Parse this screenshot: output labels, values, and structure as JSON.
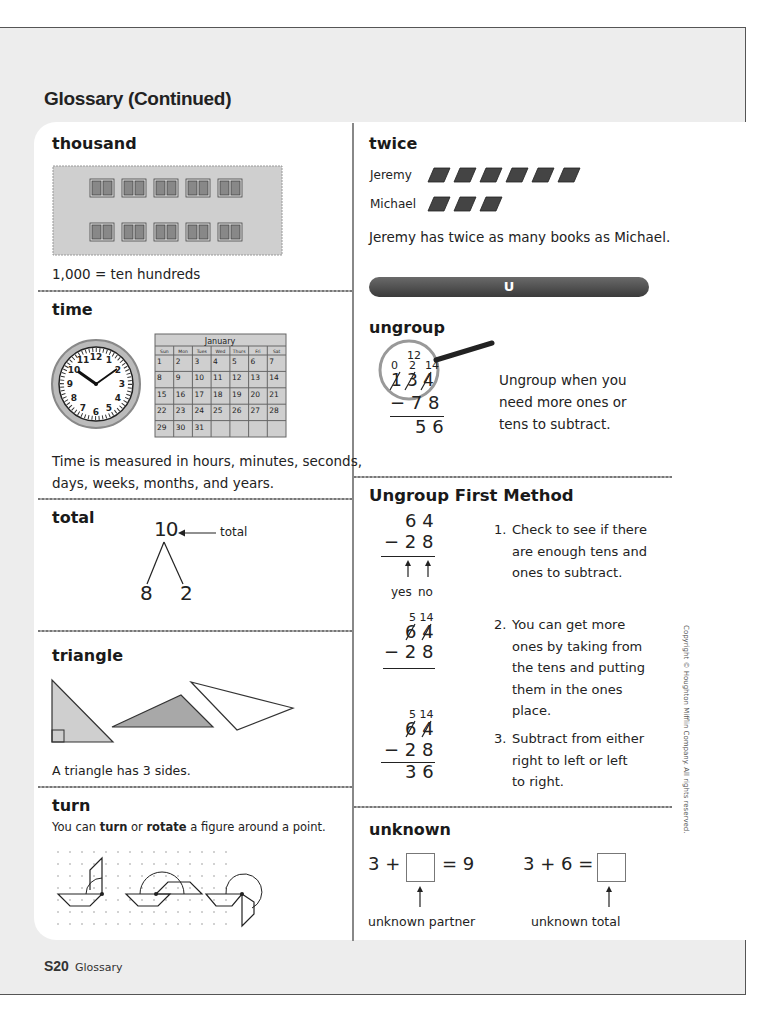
{
  "page": {
    "title": "Glossary (Continued)",
    "footer": {
      "page_number": "S20",
      "section": "Glossary"
    },
    "copyright": "Copyright © Houghton Mifflin Company. All rights reserved."
  },
  "left_column": {
    "thousand": {
      "term": "thousand",
      "figure": "hundred-blocks-grid",
      "blocks_per_row": 5,
      "rows": 2,
      "caption": "1,000 = ten hundreds"
    },
    "time": {
      "term": "time",
      "clock": {
        "hour": 10,
        "minute": 10,
        "numbers": [
          "12",
          "1",
          "2",
          "3",
          "4",
          "5",
          "6",
          "7",
          "8",
          "9",
          "10",
          "11"
        ]
      },
      "calendar": {
        "month": "January",
        "days_header": [
          "Sun",
          "Mon",
          "Tues",
          "Wed",
          "Thurs",
          "Fri",
          "Sat"
        ],
        "weeks": [
          [
            "1",
            "2",
            "3",
            "4",
            "5",
            "6",
            "7"
          ],
          [
            "8",
            "9",
            "10",
            "11",
            "12",
            "13",
            "14"
          ],
          [
            "15",
            "16",
            "17",
            "18",
            "19",
            "20",
            "21"
          ],
          [
            "22",
            "23",
            "24",
            "25",
            "26",
            "27",
            "28"
          ],
          [
            "29",
            "30",
            "31",
            "",
            "",
            "",
            ""
          ]
        ]
      },
      "caption_line1": "Time is measured in hours, minutes, seconds,",
      "caption_line2": "days, weeks, months, and years."
    },
    "total": {
      "term": "total",
      "top": "10",
      "arrow_label": "total",
      "parts": [
        "8",
        "2"
      ]
    },
    "triangle": {
      "term": "triangle",
      "caption": "A triangle has 3 sides."
    },
    "turn": {
      "term": "turn",
      "caption_pre": "You can ",
      "caption_bold1": "turn",
      "caption_mid": " or ",
      "caption_bold2": "rotate",
      "caption_post": " a figure around a point."
    }
  },
  "right_column": {
    "twice": {
      "term": "twice",
      "rows": [
        {
          "name": "Jeremy",
          "books": 6
        },
        {
          "name": "Michael",
          "books": 3
        }
      ],
      "caption": "Jeremy has twice as many books as Michael."
    },
    "letter_bar": "U",
    "ungroup": {
      "term": "ungroup",
      "regroup_top": "12",
      "regroup_marks": [
        "0",
        "2",
        "14"
      ],
      "original": [
        "1",
        "3",
        "4"
      ],
      "subtrahend": "− 7 8",
      "result": "5 6",
      "caption_line1": "Ungroup when you",
      "caption_line2": "need more ones or",
      "caption_line3": "tens to subtract."
    },
    "ungroup_first_method": {
      "term": "Ungroup First Method",
      "example1": {
        "top": "6 4",
        "sub": "− 2 8",
        "labels": [
          "yes",
          "no"
        ]
      },
      "example2": {
        "marks": "5 14",
        "top": "6 4",
        "sub": "− 2 8"
      },
      "example3": {
        "marks": "5 14",
        "top": "6 4",
        "sub": "− 2 8",
        "result": "3 6"
      },
      "steps": [
        {
          "num": "1.",
          "lines": [
            "Check to see if there",
            "are enough tens and",
            "ones to subtract."
          ]
        },
        {
          "num": "2.",
          "lines": [
            "You can get more",
            "ones by taking from",
            "the tens and putting",
            "them in the ones",
            "place."
          ]
        },
        {
          "num": "3.",
          "lines": [
            "Subtract from either",
            "right to left or left",
            "to right."
          ]
        }
      ]
    },
    "unknown": {
      "term": "unknown",
      "eq1": {
        "left": "3 +",
        "right": "= 9",
        "label": "unknown partner"
      },
      "eq2": {
        "left": "3 + 6 =",
        "label": "unknown total"
      }
    }
  }
}
